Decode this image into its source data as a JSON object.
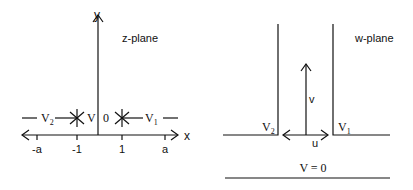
{
  "z_plane": {
    "title": "z-plane",
    "axis_x_label": "x",
    "axis_y_label": "y",
    "ticks": [
      {
        "label": "-a",
        "x": 37
      },
      {
        "label": "-1",
        "x": 77
      },
      {
        "label": "1",
        "x": 122
      },
      {
        "label": "a",
        "x": 165
      }
    ],
    "potential_left": "V",
    "potential_left_sub": "2",
    "potential_center": "V = 0",
    "potential_right": "V",
    "potential_right_sub": "1"
  },
  "w_plane": {
    "title": "w-plane",
    "axis_u_label": "u",
    "axis_v_label": "v",
    "potential_left": "V",
    "potential_left_sub": "2",
    "potential_right": "V",
    "potential_right_sub": "1",
    "potential_bottom": "V = 0"
  },
  "colors": {
    "stroke": "#111111",
    "background": "#ffffff"
  }
}
